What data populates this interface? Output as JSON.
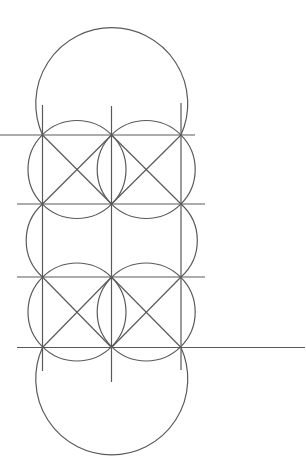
{
  "diagram": {
    "title": "",
    "stroke_color": "#5a5a5a",
    "background": "#ffffff",
    "grid": {
      "columns_x": [
        42.5,
        111.5,
        181
      ],
      "rows_y": [
        135,
        204,
        277,
        347
      ]
    },
    "horizontal_lines": [
      {
        "y": 135,
        "x1": 0,
        "x2": 195
      },
      {
        "y": 204,
        "x1": 17,
        "x2": 205
      },
      {
        "y": 277,
        "x1": 17,
        "x2": 205
      },
      {
        "y": 347.5,
        "x1": 17,
        "x2": 305
      }
    ],
    "vertical_lines": [
      {
        "x": 42.5,
        "y1": 105,
        "y2": 371
      },
      {
        "x": 111.5,
        "y1": 106,
        "y2": 382
      },
      {
        "x": 181,
        "y1": 103,
        "y2": 370
      }
    ],
    "diagonals": [
      {
        "x1": 42.5,
        "y1": 135,
        "x2": 111.5,
        "y2": 204
      },
      {
        "x1": 111.5,
        "y1": 135,
        "x2": 42.5,
        "y2": 204
      },
      {
        "x1": 111.5,
        "y1": 135,
        "x2": 181,
        "y2": 204
      },
      {
        "x1": 181,
        "y1": 135,
        "x2": 111.5,
        "y2": 204
      },
      {
        "x1": 42.5,
        "y1": 277,
        "x2": 111.5,
        "y2": 347.5
      },
      {
        "x1": 111.5,
        "y1": 277,
        "x2": 42.5,
        "y2": 347.5
      },
      {
        "x1": 111.5,
        "y1": 277,
        "x2": 181,
        "y2": 347.5
      },
      {
        "x1": 181,
        "y1": 277,
        "x2": 111.5,
        "y2": 347.5
      }
    ],
    "cell_circles": [
      {
        "cx": 77,
        "cy": 169.5,
        "r": 49
      },
      {
        "cx": 146.2,
        "cy": 169.5,
        "r": 49
      },
      {
        "cx": 77,
        "cy": 312,
        "r": 49
      },
      {
        "cx": 146.2,
        "cy": 312,
        "r": 49
      }
    ],
    "middle_arcs": [
      {
        "d": "M 42.5 204 A 49 49 0 0 0 42.5 277"
      },
      {
        "d": "M 181 204 A 49 49 0 0 1 181 277"
      }
    ],
    "top_arc": {
      "d": "M 42.5 135 A 76 76 0 1 1 181 135"
    },
    "bottom_arc": {
      "d": "M 42.5 347.5 A 76 76 0 1 0 181 347.5"
    }
  }
}
